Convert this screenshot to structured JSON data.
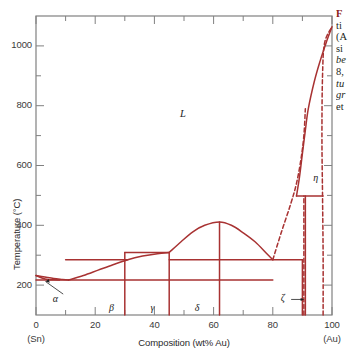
{
  "figure": {
    "caption_lines": [
      "F",
      "ti",
      "(A",
      "si",
      "be",
      "8,",
      "tu",
      "gr",
      "et",
      "P."
    ]
  },
  "axes": {
    "y_title": "Temperature (°C)",
    "x_title": "Composition (wt% Au)",
    "y_ticks_major": [
      "200",
      "400",
      "600",
      "800",
      "1000"
    ],
    "y_ticks_minor": [
      "100",
      "300",
      "500",
      "700",
      "900",
      "1100"
    ],
    "x_ticks_major": [
      "0",
      "20",
      "40",
      "60",
      "80",
      "100"
    ],
    "x_ticks_minor": [
      "10",
      "30",
      "50",
      "70",
      "90"
    ],
    "x_left_endpoint_element": "(Sn)",
    "x_right_endpoint_element": "(Au)"
  },
  "phase_labels": [
    {
      "name": "liquid",
      "text": "L",
      "x_wt": 50,
      "y_c": 770
    },
    {
      "name": "alpha",
      "text": "α",
      "x_wt": 7,
      "y_c": 150
    },
    {
      "name": "beta",
      "text": "β",
      "x_wt": 26,
      "y_c": 120
    },
    {
      "name": "gamma",
      "text": "γ",
      "x_wt": 40,
      "y_c": 120
    },
    {
      "name": "delta",
      "text": "δ",
      "x_wt": 55,
      "y_c": 120
    },
    {
      "name": "zeta",
      "text": "ζ",
      "x_wt": 84,
      "y_c": 155
    },
    {
      "name": "eta",
      "text": "η",
      "x_wt": 95,
      "y_c": 555
    }
  ],
  "colors": {
    "phase_line": "#a83232",
    "frame": "#808080",
    "tick": "#808080",
    "text": "#2a2a2a",
    "caption_accent": "#8b1a1a",
    "background": "#ffffff"
  },
  "chart_data": {
    "type": "line",
    "title": "",
    "subtitle": "",
    "xlabel": "Composition (wt% Au)",
    "ylabel": "Temperature (°C)",
    "xlim": [
      0,
      100
    ],
    "ylim": [
      100,
      1100
    ],
    "grid": false,
    "legend": "none",
    "x_endpoint_labels": {
      "left": "(Sn)",
      "right": "(Au)"
    },
    "y_tick_values": [
      200,
      400,
      600,
      800,
      1000
    ],
    "y_minor_tick_values": [
      100,
      300,
      500,
      700,
      900,
      1100
    ],
    "x_tick_values": [
      0,
      20,
      40,
      60,
      80,
      100
    ],
    "x_minor_tick_values": [
      10,
      30,
      50,
      70,
      90
    ],
    "series": [
      {
        "name": "Sn-rich liquidus (left branch)",
        "style": "solid",
        "points": [
          [
            0,
            232
          ],
          [
            3,
            227
          ],
          [
            6,
            222
          ],
          [
            9,
            219
          ],
          [
            11,
            217
          ]
        ]
      },
      {
        "name": "alpha solidus (Sn-rich)",
        "style": "solid",
        "points": [
          [
            0,
            232
          ],
          [
            2,
            224
          ],
          [
            4,
            219
          ],
          [
            6,
            217.5
          ],
          [
            8,
            217
          ]
        ]
      },
      {
        "name": "liquidus rising to beta/gamma plateau",
        "style": "solid",
        "points": [
          [
            11,
            217
          ],
          [
            16,
            232
          ],
          [
            21,
            250
          ],
          [
            26,
            268
          ],
          [
            31,
            285
          ],
          [
            36,
            297
          ],
          [
            41,
            305
          ],
          [
            45,
            309
          ]
        ]
      },
      {
        "name": "delta dome liquidus",
        "style": "solid",
        "points": [
          [
            45,
            309
          ],
          [
            49,
            345
          ],
          [
            53,
            378
          ],
          [
            57,
            400
          ],
          [
            62,
            411
          ],
          [
            66,
            400
          ],
          [
            70,
            375
          ],
          [
            74,
            345
          ],
          [
            78,
            305
          ],
          [
            80,
            285
          ]
        ]
      },
      {
        "name": "Au-rich liquidus",
        "style": "solid",
        "points": [
          [
            88,
            498
          ],
          [
            89,
            560
          ],
          [
            90,
            640
          ],
          [
            91,
            718
          ],
          [
            92,
            790
          ],
          [
            94,
            880
          ],
          [
            96,
            950
          ],
          [
            98,
            1010
          ],
          [
            100,
            1064
          ]
        ]
      },
      {
        "name": "eutectic horizontal (Sn-rich) 217 C",
        "style": "solid-horizontal",
        "y_c": 217,
        "x_range": [
          0,
          80
        ]
      },
      {
        "name": "beta/gamma plateau horizontal 309 C",
        "style": "solid-horizontal",
        "y_c": 309,
        "x_range": [
          30,
          45
        ]
      },
      {
        "name": "gamma plateau horizontal 285 C",
        "style": "solid-horizontal",
        "y_c": 285,
        "x_range": [
          10,
          31
        ]
      },
      {
        "name": "delta base horizontal 285 C",
        "style": "solid-horizontal",
        "y_c": 285,
        "x_range": [
          45,
          90
        ]
      },
      {
        "name": "eta peritectic horizontal 498 C",
        "style": "solid-horizontal",
        "y_c": 498,
        "x_range": [
          88,
          97
        ]
      },
      {
        "name": "beta vertical boundary",
        "style": "solid-vertical",
        "x_wt": 30,
        "y_range": [
          100,
          309
        ]
      },
      {
        "name": "gamma vertical boundary",
        "style": "solid-vertical",
        "x_wt": 45,
        "y_range": [
          100,
          309
        ]
      },
      {
        "name": "delta vertical boundary",
        "style": "solid-vertical",
        "x_wt": 62,
        "y_range": [
          100,
          411
        ]
      },
      {
        "name": "delta right vertical boundary",
        "style": "solid-vertical",
        "x_wt": 90,
        "y_range": [
          100,
          285
        ]
      },
      {
        "name": "zeta vertical boundary",
        "style": "solid-vertical",
        "x_wt": 91,
        "y_range": [
          100,
          498
        ]
      },
      {
        "name": "eta dashed vertical boundary",
        "style": "dashed-vertical",
        "x_wt": 90.5,
        "y_range": [
          100,
          498
        ]
      },
      {
        "name": "Au solvus dashed",
        "style": "dashed",
        "points": [
          [
            97,
            100
          ],
          [
            97,
            300
          ],
          [
            96.8,
            500
          ],
          [
            96.6,
            700
          ],
          [
            96.8,
            900
          ],
          [
            97.5,
            1010
          ],
          [
            100,
            1064
          ]
        ]
      },
      {
        "name": "delta-to-liquidus dashed tie",
        "style": "dashed",
        "points": [
          [
            80,
            285
          ],
          [
            83,
            380
          ],
          [
            86,
            470
          ],
          [
            88,
            540
          ],
          [
            89.5,
            620
          ],
          [
            90.5,
            700
          ],
          [
            91,
            790
          ]
        ]
      }
    ],
    "annotations": [
      {
        "text": "L",
        "x_wt": 50,
        "y_c": 770,
        "note": "liquid field"
      },
      {
        "text": "α",
        "x_wt": 7,
        "y_c": 150,
        "note": "leader line to Sn-rich solid solution"
      },
      {
        "text": "β",
        "x_wt": 26,
        "y_c": 120
      },
      {
        "text": "γ",
        "x_wt": 40,
        "y_c": 120
      },
      {
        "text": "δ",
        "x_wt": 55,
        "y_c": 120
      },
      {
        "text": "ζ",
        "x_wt": 84,
        "y_c": 155,
        "note": "arrow pointing right to narrow zeta field"
      },
      {
        "text": "η",
        "x_wt": 95,
        "y_c": 555
      }
    ]
  }
}
